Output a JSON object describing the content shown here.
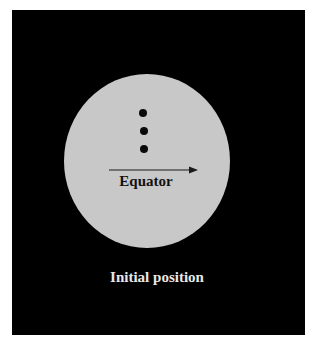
{
  "diagram": {
    "background_color": "#000000",
    "sphere": {
      "shape": "circle",
      "fill": "#c8c8c8",
      "cx": 147,
      "cy": 161,
      "rx": 83,
      "ry": 87
    },
    "markers": [
      {
        "name": "dot-1",
        "cx": 143,
        "cy": 113,
        "r": 4
      },
      {
        "name": "dot-2",
        "cx": 144,
        "cy": 131,
        "r": 4
      },
      {
        "name": "dot-3",
        "cx": 144,
        "cy": 149,
        "r": 4
      }
    ],
    "arrow": {
      "icon": "right-arrow-icon",
      "x1": 109,
      "y1": 170,
      "x2": 198,
      "y2": 170
    },
    "labels": {
      "equator": "Equator",
      "caption": "Initial position"
    }
  }
}
